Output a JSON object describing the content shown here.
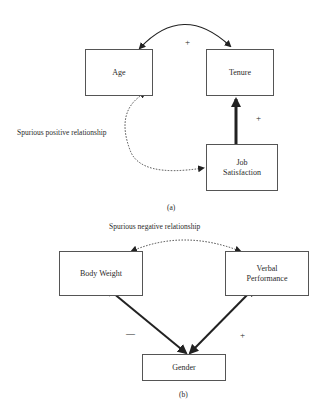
{
  "panel_a": {
    "caption": "(a)",
    "nodes": {
      "age": "Age",
      "tenure": "Tenure",
      "job_satisfaction": "Job\nSatisfaction"
    },
    "edges": {
      "age_tenure_sign": "+",
      "job_tenure_sign": "+",
      "spurious_label": "Spurious positive relationship"
    }
  },
  "panel_b": {
    "caption": "(b)",
    "nodes": {
      "body_weight": "Body Weight",
      "verbal_performance": "Verbal\nPerformance",
      "gender": "Gender"
    },
    "edges": {
      "spurious_label": "Spurious negative relationship",
      "gender_body_sign": "—",
      "gender_verbal_sign": "+"
    }
  }
}
